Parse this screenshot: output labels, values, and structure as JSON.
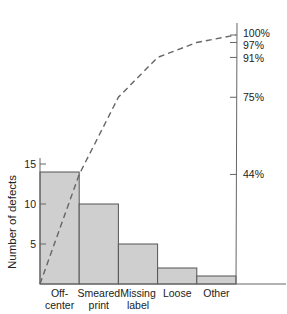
{
  "chart_data": {
    "type": "bar",
    "title": "",
    "subtitle": "Pareto chart",
    "xlabel": "",
    "ylabel": "Number of defects",
    "ylim": [
      0,
      15
    ],
    "categories": [
      "Off-center",
      "Smeared print",
      "Missing label",
      "Loose",
      "Other"
    ],
    "category_lines": [
      [
        "Off-",
        "center"
      ],
      [
        "Smeared",
        "print"
      ],
      [
        "Missing",
        "label"
      ],
      [
        "Loose"
      ],
      [
        "Other"
      ]
    ],
    "values": [
      14,
      10,
      5,
      2,
      1
    ],
    "y_ticks": [
      "5",
      "10",
      "15"
    ],
    "series": [
      {
        "name": "Number of defects",
        "type": "bar",
        "values": [
          14,
          10,
          5,
          2,
          1
        ]
      },
      {
        "name": "Cumulative percentage",
        "type": "line",
        "style": "dashed",
        "values": [
          44,
          75,
          91,
          97,
          100
        ]
      }
    ],
    "right_axis": {
      "ticks": [
        "44%",
        "75%",
        "91%",
        "97%",
        "100%"
      ],
      "range": [
        0,
        100
      ]
    },
    "grid": false,
    "legend": "none",
    "colors": {
      "bar_fill": "#cfcfcf",
      "bar_stroke": "#555555",
      "line": "#666666",
      "axis": "#666666"
    }
  }
}
